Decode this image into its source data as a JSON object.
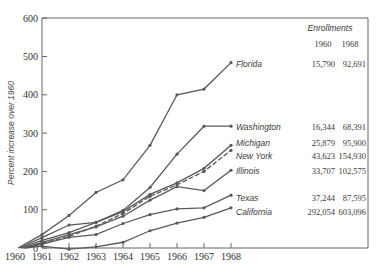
{
  "chart_data": {
    "type": "line",
    "title": "",
    "xlabel": "",
    "ylabel": "Percent increase over 1960",
    "x": [
      1960,
      1961,
      1962,
      1963,
      1964,
      1965,
      1966,
      1967,
      1968
    ],
    "x_tick_labels": [
      "1960",
      "1961",
      "1962",
      "1963",
      "1964",
      "1965",
      "1966",
      "1967",
      "1968"
    ],
    "y_tick_labels": [
      "0",
      "100",
      "200",
      "300",
      "400",
      "500",
      "600"
    ],
    "ylim": [
      0,
      600
    ],
    "grid": false,
    "legend_position": "right (direct line labels)",
    "series": [
      {
        "name": "Florida",
        "style": "solid",
        "values": [
          0,
          35,
          85,
          145,
          178,
          268,
          400,
          415,
          484
        ]
      },
      {
        "name": "Washington",
        "style": "solid",
        "values": [
          0,
          27,
          60,
          67,
          98,
          158,
          245,
          318,
          318
        ]
      },
      {
        "name": "Michigan",
        "style": "solid",
        "values": [
          0,
          20,
          40,
          67,
          95,
          140,
          170,
          208,
          268
        ]
      },
      {
        "name": "New York",
        "style": "dashed",
        "values": [
          0,
          12,
          30,
          57,
          90,
          135,
          165,
          200,
          255
        ]
      },
      {
        "name": "Illinois",
        "style": "solid",
        "values": [
          0,
          15,
          35,
          55,
          83,
          125,
          160,
          150,
          203
        ]
      },
      {
        "name": "Texas",
        "style": "solid",
        "values": [
          0,
          10,
          28,
          35,
          64,
          87,
          102,
          105,
          138
        ]
      },
      {
        "name": "California",
        "style": "solid",
        "values": [
          0,
          5,
          -3,
          3,
          15,
          45,
          65,
          80,
          105
        ]
      }
    ],
    "table": {
      "title": "Enrollments",
      "columns": [
        "1960",
        "1968"
      ],
      "rows": [
        {
          "state": "Florida",
          "y1960": "15,790",
          "y1968": "92,691"
        },
        {
          "state": "Washington",
          "y1960": "16,344",
          "y1968": "68,391"
        },
        {
          "state": "Michigan",
          "y1960": "25,879",
          "y1968": "95,900"
        },
        {
          "state": "New York",
          "y1960": "43,623",
          "y1968": "154,930"
        },
        {
          "state": "Illinois",
          "y1960": "33,707",
          "y1968": "102,575"
        },
        {
          "state": "Texas",
          "y1960": "37,244",
          "y1968": "87,595"
        },
        {
          "state": "California",
          "y1960": "292,054",
          "y1968": "603,096"
        }
      ]
    }
  },
  "colors": {
    "line": "#5a5a5a",
    "axis": "#666666",
    "text": "#3a3a3a"
  }
}
